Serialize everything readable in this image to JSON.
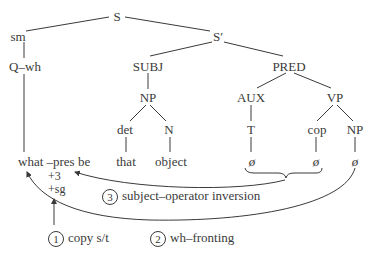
{
  "diagram": {
    "type": "syntax-tree",
    "nodes": {
      "S": "S",
      "sm": "sm",
      "S_bar": "S′",
      "Q_wh": "Q–wh",
      "SUBJ": "SUBJ",
      "PRED": "PRED",
      "NP_subj": "NP",
      "AUX": "AUX",
      "VP": "VP",
      "det": "det",
      "N": "N",
      "T": "T",
      "cop": "cop",
      "NP_obj": "NP",
      "that": "that",
      "object": "object",
      "surface": "what –pres be",
      "feat1": "+3",
      "feat2": "+sg",
      "empty_T": "ø",
      "empty_cop": "ø",
      "empty_NP": "ø"
    },
    "operations": [
      {
        "number": "1",
        "label": "copy s/t"
      },
      {
        "number": "2",
        "label": "wh–fronting"
      },
      {
        "number": "3",
        "label": "subject–operator inversion"
      }
    ],
    "colors": {
      "ink": "#3a3a3a",
      "background": "#ffffff"
    }
  }
}
